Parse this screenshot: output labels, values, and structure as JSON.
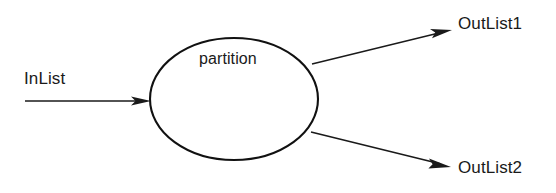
{
  "diagram": {
    "type": "dataflow-diagram",
    "background_color": "#ffffff",
    "line_color": "#1a1a1a",
    "node": {
      "shape": "ellipse",
      "label": "partition"
    },
    "inputs": [
      {
        "label": "InList",
        "direction": "into-node"
      }
    ],
    "outputs": [
      {
        "label": "OutList1",
        "direction": "out-of-node-upper-right"
      },
      {
        "label": "OutList2",
        "direction": "out-of-node-lower-right"
      }
    ],
    "edges": [
      {
        "from": "InList",
        "to": "partition"
      },
      {
        "from": "partition",
        "to": "OutList1"
      },
      {
        "from": "partition",
        "to": "OutList2"
      }
    ]
  }
}
